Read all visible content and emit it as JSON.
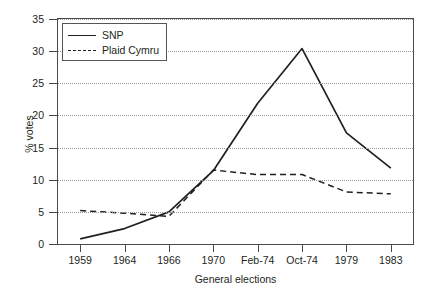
{
  "chart_data": {
    "type": "line",
    "title": "",
    "xlabel": "General elections",
    "ylabel": "% votes",
    "categories": [
      "1959",
      "1964",
      "1966",
      "1970",
      "Feb-74",
      "Oct-74",
      "1979",
      "1983"
    ],
    "series": [
      {
        "name": "SNP",
        "style": "solid",
        "values": [
          0.8,
          2.4,
          5.0,
          11.4,
          21.9,
          30.4,
          17.3,
          11.8
        ]
      },
      {
        "name": "Plaid Cymru",
        "style": "dashed",
        "values": [
          5.2,
          4.8,
          4.3,
          11.5,
          10.8,
          10.8,
          8.1,
          7.8
        ]
      }
    ],
    "ylim": [
      0,
      35
    ],
    "yticks": [
      "0",
      "5",
      "10",
      "15",
      "20",
      "25",
      "30",
      "35"
    ],
    "grid": true,
    "legend_position": "top-left",
    "colors": {
      "line": "#231f20",
      "axis": "#4a4a4a",
      "grid": "#9a9a9a",
      "background": "#ffffff"
    }
  },
  "legend": {
    "items": [
      {
        "label": "SNP"
      },
      {
        "label": "Plaid Cymru"
      }
    ]
  }
}
